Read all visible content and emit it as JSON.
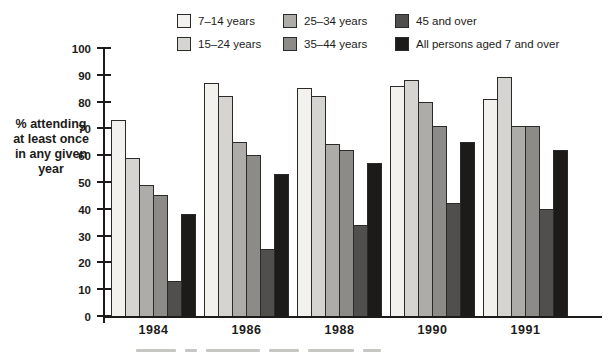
{
  "legend": {
    "items": [
      {
        "label": "7–14 years",
        "color": "#f2f1ed"
      },
      {
        "label": "25–34 years",
        "color": "#adaca8"
      },
      {
        "label": "45 and over",
        "color": "#504f4d"
      },
      {
        "label": "15–24 years",
        "color": "#d5d4d0"
      },
      {
        "label": "35–44 years",
        "color": "#8c8b88"
      },
      {
        "label": "All persons aged 7 and over",
        "color": "#1c1b1a"
      }
    ]
  },
  "y_axis": {
    "title_lines": [
      "% attending",
      "at least once",
      "in any given",
      "year"
    ],
    "ticks": [
      0,
      10,
      20,
      30,
      40,
      50,
      60,
      70,
      80,
      90,
      100
    ]
  },
  "chart_data": {
    "type": "bar",
    "title": "",
    "xlabel": "",
    "ylabel": "% attending at least once in any given year",
    "ylim": [
      0,
      100
    ],
    "grid": false,
    "legend_position": "top",
    "categories": [
      "1984",
      "1986",
      "1988",
      "1990",
      "1991"
    ],
    "series": [
      {
        "name": "7–14 years",
        "color": "#f2f1ed",
        "values": [
          73,
          87,
          85,
          86,
          81
        ]
      },
      {
        "name": "15–24 years",
        "color": "#d5d4d0",
        "values": [
          59,
          82,
          82,
          88,
          89
        ]
      },
      {
        "name": "25–34 years",
        "color": "#adaca8",
        "values": [
          49,
          65,
          64,
          80,
          71
        ]
      },
      {
        "name": "35–44 years",
        "color": "#8c8b88",
        "values": [
          45,
          60,
          62,
          71,
          71
        ]
      },
      {
        "name": "45 and over",
        "color": "#504f4d",
        "values": [
          13,
          25,
          34,
          42,
          40
        ]
      },
      {
        "name": "All persons aged 7 and over",
        "color": "#1c1b1a",
        "values": [
          38,
          53,
          57,
          65,
          62
        ]
      }
    ],
    "axis_color": "#1c1b1a"
  }
}
